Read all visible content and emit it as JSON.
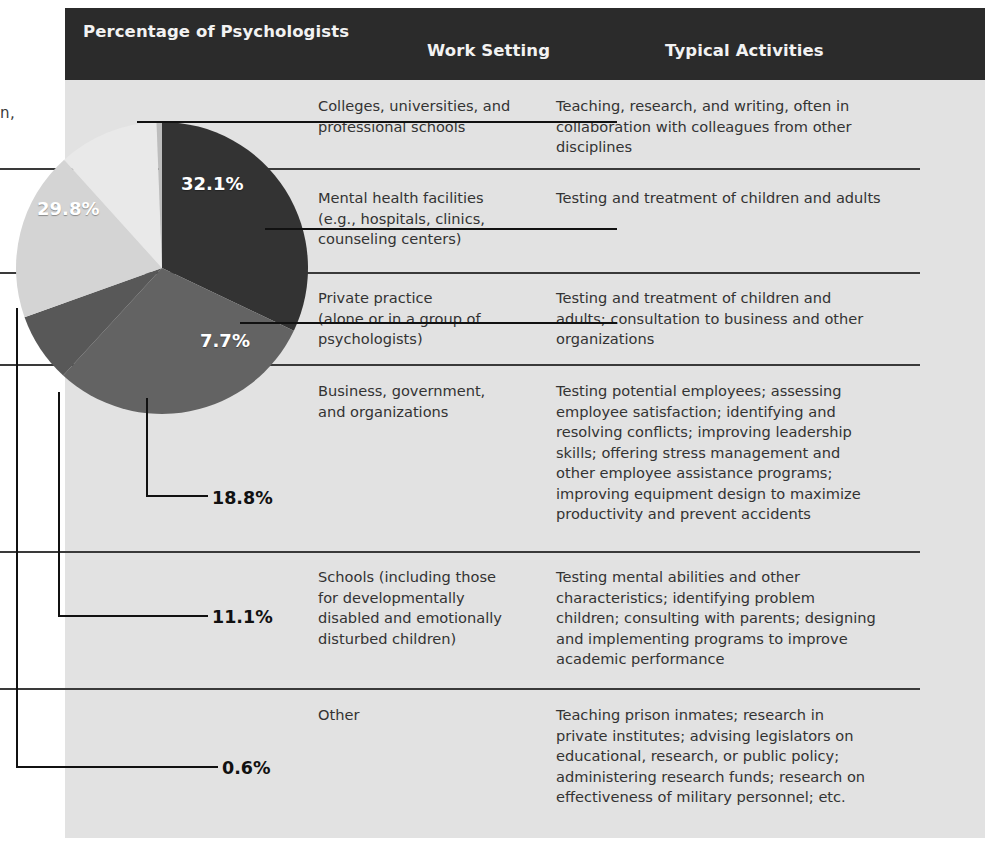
{
  "header": {
    "percentage_label": "Percentage of\nPsychologists",
    "work_setting_label": "Work Setting",
    "typical_activities_label": "Typical Activities",
    "bar_color": "#2b2b2b",
    "text_color": "#f2f2f2"
  },
  "table": {
    "background": "#e2e2e2",
    "rule_color": "#3a3a3a",
    "rows": [
      {
        "percent": "32.1%",
        "work_setting": "Colleges, universities, and\nprofessional schools",
        "typical_activities": "Teaching, research, and writing, often in\ncollaboration with colleagues from other\ndisciplines"
      },
      {
        "percent": "29.8%",
        "work_setting": "Mental health facilities\n(e.g., hospitals, clinics,\ncounseling centers)",
        "typical_activities": "Testing and treatment of children and adults"
      },
      {
        "percent": "7.7%",
        "work_setting": "Private practice\n(alone or in a group of\npsychologists)",
        "typical_activities": "Testing and treatment of children and\nadults; consultation to business and other\norganizations"
      },
      {
        "percent": "18.8%",
        "work_setting": "Business, government,\nand organizations",
        "typical_activities": "Testing potential employees; assessing\nemployee satisfaction; identifying and\nresolving conflicts; improving leadership\nskills; offering stress management and\nother employee assistance programs;\nimproving equipment design to maximize\nproductivity and prevent accidents"
      },
      {
        "percent": "11.1%",
        "work_setting": "Schools (including those\nfor developmentally\ndisabled and emotionally\ndisturbed children)",
        "typical_activities": "Testing mental abilities and other\ncharacteristics; identifying problem\nchildren; consulting with parents; designing\nand implementing programs to improve\nacademic performance"
      },
      {
        "percent": "0.6%",
        "work_setting": "Other",
        "typical_activities": "Teaching prison inmates; research in\nprivate institutes; advising legislators on\neducational, research, or public policy;\nadministering research funds; research on\neffectiveness of military personnel; etc."
      }
    ]
  },
  "margin_fragment": "n,",
  "chart_data": {
    "type": "pie",
    "title": "Percentage of Psychologists",
    "categories": [
      "Colleges, universities, and professional schools",
      "Mental health facilities (e.g., hospitals, clinics, counseling centers)",
      "Private practice (alone or in a group of psychologists)",
      "Business, government, and organizations",
      "Schools (including those for developmentally disabled and emotionally disturbed children)",
      "Other"
    ],
    "values": [
      32.1,
      29.8,
      7.7,
      18.8,
      11.1,
      0.6
    ],
    "labels": [
      "32.1%",
      "29.8%",
      "7.7%",
      "18.8%",
      "11.1%",
      "0.6%"
    ],
    "colors": [
      "#333333",
      "#636363",
      "#585858",
      "#d4d4d4",
      "#e9e9e9",
      "#bdbdbd"
    ],
    "label_colors": [
      "#ffffff",
      "#ffffff",
      "#ffffff",
      "#111111",
      "#111111",
      "#111111"
    ],
    "legend": "none",
    "start_angle_deg": 0,
    "direction": "clockwise"
  }
}
